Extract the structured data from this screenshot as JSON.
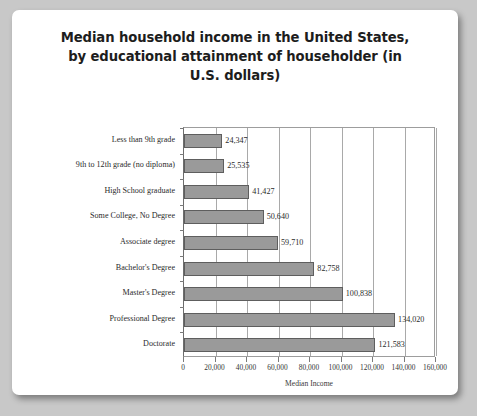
{
  "chart_data": {
    "type": "bar",
    "orientation": "horizontal",
    "title": "Median household income in the United States, by educational attainment of householder (in U.S. dollars)",
    "title_lines": [
      "Median household income in the United States,",
      "by educational attainment of householder (in",
      "U.S. dollars)"
    ],
    "xlabel": "Median Income",
    "ylabel": "",
    "xlim": [
      0,
      160000
    ],
    "ylim": null,
    "grid": true,
    "legend": false,
    "categories": [
      "Less than 9th grade",
      "9th to 12th grade (no diploma)",
      "High School graduate",
      "Some College, No Degree",
      "Associate degree",
      "Bachelor's Degree",
      "Master's Degree",
      "Professional Degree",
      "Doctorate"
    ],
    "values": [
      24347,
      25535,
      41427,
      50640,
      59710,
      82758,
      100838,
      134020,
      121583
    ],
    "value_labels": [
      "24,347",
      "25,535",
      "41,427",
      "50,640",
      "59,710",
      "82,758",
      "100,838",
      "134,020",
      "121,583"
    ],
    "xticks": [
      0,
      20000,
      40000,
      60000,
      80000,
      100000,
      120000,
      140000,
      160000
    ],
    "xtick_labels": [
      "0",
      "20,000",
      "40,000",
      "60,000",
      "80,000",
      "100,000",
      "120,000",
      "140,000",
      "160,000"
    ],
    "bar_color": "#9a9a9a",
    "bar_border_color": "#5e5e5e",
    "plot_background": "#ffffff",
    "page_background": "#ffffff"
  }
}
